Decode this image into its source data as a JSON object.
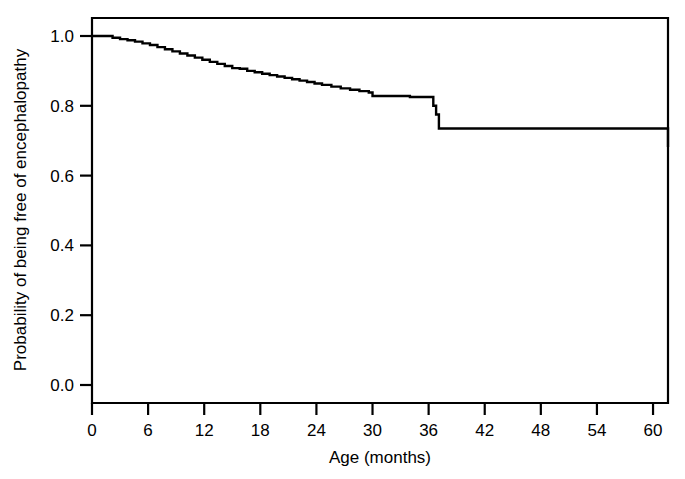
{
  "chart_data": {
    "type": "line",
    "title": "",
    "subtitle": "",
    "xlabel": "Age (months)",
    "ylabel": "Probability of being free of encephalopathy",
    "xlim": [
      0,
      61.6
    ],
    "ylim": [
      0.0,
      1.04
    ],
    "grid": false,
    "legend": "none",
    "curve_style": "step-post (Kaplan-Meier survival)",
    "x_ticks": [
      0,
      6,
      12,
      18,
      24,
      30,
      36,
      42,
      48,
      54,
      60
    ],
    "x_tick_labels": [
      "0",
      "6",
      "12",
      "18",
      "24",
      "30",
      "36",
      "42",
      "48",
      "54",
      "60"
    ],
    "y_ticks": [
      0.0,
      0.2,
      0.4,
      0.6,
      0.8,
      1.0
    ],
    "y_tick_labels": [
      "0.0",
      "0.2",
      "0.4",
      "0.6",
      "0.8",
      "1.0"
    ],
    "series": [
      {
        "name": "Freedom from encephalopathy",
        "x": [
          0.0,
          1.2,
          2.2,
          3.0,
          3.8,
          4.6,
          5.4,
          6.2,
          7.0,
          7.8,
          8.6,
          9.4,
          10.2,
          11.0,
          11.8,
          12.6,
          13.4,
          14.2,
          15.0,
          15.8,
          16.6,
          17.4,
          18.2,
          19.0,
          19.8,
          20.6,
          21.4,
          22.2,
          23.0,
          23.8,
          24.6,
          25.6,
          26.6,
          27.6,
          28.6,
          29.6,
          30.0,
          33.2,
          34.0,
          35.0,
          36.2,
          36.5,
          36.8,
          37.1,
          48.4,
          61.6
        ],
        "y": [
          1.0,
          1.0,
          0.995,
          0.991,
          0.988,
          0.984,
          0.979,
          0.974,
          0.968,
          0.962,
          0.956,
          0.95,
          0.944,
          0.938,
          0.932,
          0.926,
          0.92,
          0.914,
          0.908,
          0.906,
          0.9,
          0.896,
          0.892,
          0.888,
          0.884,
          0.88,
          0.876,
          0.872,
          0.868,
          0.864,
          0.86,
          0.855,
          0.85,
          0.846,
          0.842,
          0.838,
          0.828,
          0.828,
          0.825,
          0.825,
          0.825,
          0.8,
          0.775,
          0.735,
          0.735,
          0.682
        ],
        "color": "#000000"
      }
    ],
    "key_events": [
      {
        "age_months": 30.0,
        "probability": 0.828,
        "note": "step down to plateau near 0.83"
      },
      {
        "age_months": 36.5,
        "probability": 0.735,
        "note": "largest drop, ~0.825 to ~0.735"
      },
      {
        "age_months": 48.4,
        "probability": 0.682,
        "note": "final drop to plateau ~0.68"
      },
      {
        "age_months": 61.6,
        "probability": 0.682,
        "note": "end of follow-up"
      }
    ]
  },
  "axes": {
    "x_axis_name": "age-axis",
    "y_axis_name": "probability-axis"
  }
}
